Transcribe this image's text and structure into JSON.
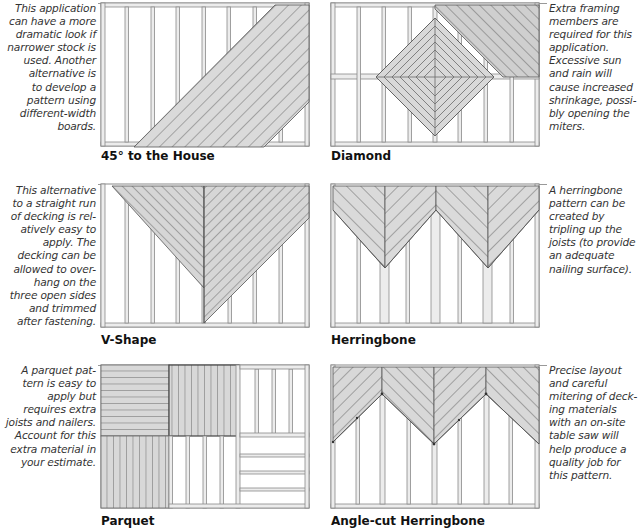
{
  "panels": [
    {
      "id": "45-to-the-house",
      "caption": "45° to the House",
      "note_side": "left",
      "note": "This application\ncan have a more\ndramatic look if\nnarrower stock is\nused. Another\nalternative is\nto develop a\npattern using\ndifferent-width\nboards."
    },
    {
      "id": "diamond",
      "caption": "Diamond",
      "note_side": "right",
      "note": "Extra framing\nmembers are\nrequired for this\napplication.\nExcessive sun\nand rain will\ncause increased\nshrinkage, possi-\nbly opening the\nmiters."
    },
    {
      "id": "v-shape",
      "caption": "V-Shape",
      "note_side": "left",
      "note": "This alternative\nto a straight run\nof decking is rel-\natively easy to\napply. The\ndecking can be\nallowed to over-\nhang on the\nthree open sides\nand trimmed\nafter fastening."
    },
    {
      "id": "herringbone",
      "caption": "Herringbone",
      "note_side": "right",
      "note": "A herringbone\npattern can be\ncreated by\ntripling up the\njoists (to provide\nan adequate\nnailing surface)."
    },
    {
      "id": "parquet",
      "caption": "Parquet",
      "note_side": "left",
      "note": "A parquet pat-\ntern is easy to\napply but\nrequires extra\njoists and nailers.\nAccount for this\nextra material in\nyour estimate."
    },
    {
      "id": "angle-cut-herringbone",
      "caption": "Angle-cut Herringbone",
      "note_side": "right",
      "note": "Precise layout\nand careful\nmitering of deck-\ning materials\nwith an on-site\ntable saw will\nhelp produce a\nquality job for\nthis pattern."
    }
  ],
  "colors": {
    "board_fill": "#d9d9d9",
    "board_line": "#6f6f6f",
    "frame_fill": "#ececec",
    "frame_line": "#8a8a8a",
    "text": "#333333"
  }
}
